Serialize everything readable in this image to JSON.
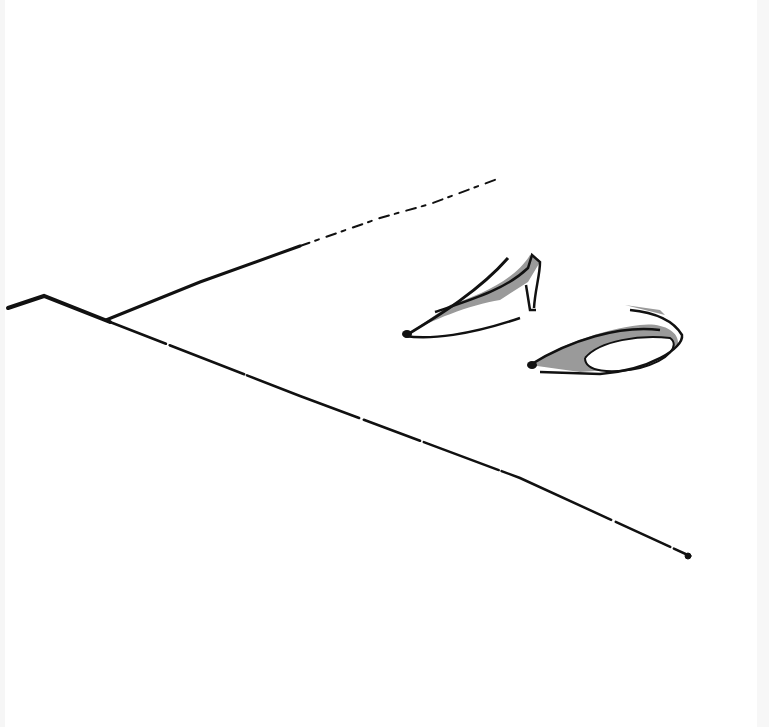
{
  "image": {
    "description": "Minimal ink sketch of a pair of high-heeled pumps resting on a floor, with diagonal floor/wall lines",
    "colors": {
      "ink": "#111111",
      "fill": "#9a9a9a",
      "background": "#ffffff"
    }
  }
}
